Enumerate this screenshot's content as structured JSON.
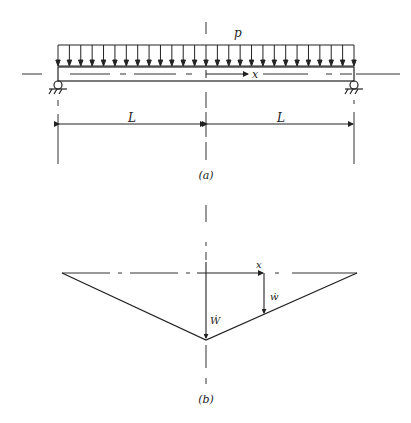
{
  "figure_a": {
    "caption": "(a)",
    "load_label": "p",
    "axis_label": "x",
    "span_labels": [
      "L",
      "L"
    ],
    "load_arrow_count": 27,
    "supports": [
      "left-roller-support",
      "right-roller-support"
    ]
  },
  "figure_b": {
    "caption": "(b)",
    "axis_label": "x",
    "local_velocity_label": "ẇ",
    "center_velocity_label": "Ẇ"
  },
  "colors": {
    "line": "#222222",
    "background": "#ffffff"
  }
}
